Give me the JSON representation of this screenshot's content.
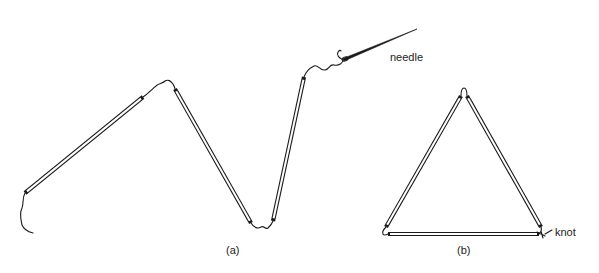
{
  "figure": {
    "panel_a": {
      "caption": "(a)",
      "needle_label": "needle",
      "description": "Three straws threaded on string with needle"
    },
    "panel_b": {
      "caption": "(b)",
      "knot_label": "knot",
      "description": "Three straws tied into triangle"
    },
    "colors": {
      "ink": "#1a1a1a",
      "background": "#ffffff"
    }
  }
}
